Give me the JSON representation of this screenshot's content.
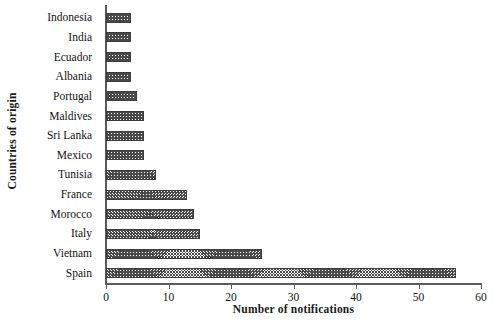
{
  "chart_data": {
    "type": "bar",
    "orientation": "horizontal",
    "title": "",
    "xlabel": "Number of notifications",
    "ylabel": "Countries of origin",
    "xlim": [
      0,
      60
    ],
    "xticks": [
      0,
      10,
      20,
      30,
      40,
      50,
      60
    ],
    "grid": false,
    "legend": null,
    "categories": [
      "Indonesia",
      "India",
      "Ecuador",
      "Albania",
      "Portugal",
      "Maldives",
      "Sri Lanka",
      "Mexico",
      "Tunisia",
      "France",
      "Morocco",
      "Italy",
      "Vietnam",
      "Spain"
    ],
    "values": [
      4,
      4,
      4,
      4,
      5,
      6,
      6,
      6,
      8,
      13,
      14,
      15,
      25,
      56
    ],
    "bar_style": {
      "fill": "cross-hatch",
      "edge_color": "#3d3d3d",
      "hatch_color": "#4a4a4a",
      "background": "#ffffff"
    }
  }
}
